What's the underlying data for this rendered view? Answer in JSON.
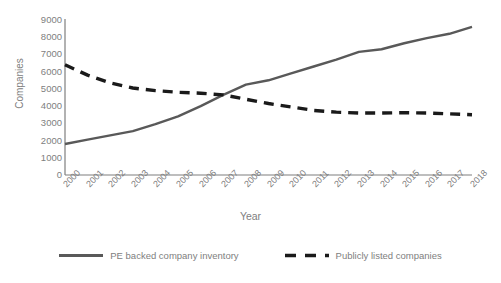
{
  "chart_data": {
    "type": "line",
    "title": "",
    "xlabel": "Year",
    "ylabel": "Companies",
    "categories": [
      "2000",
      "2001",
      "2002",
      "2003",
      "2004",
      "2005",
      "2006",
      "2007",
      "2008",
      "2009",
      "2010",
      "2011",
      "2012",
      "2013",
      "2014",
      "2015",
      "2016",
      "2017",
      "2018"
    ],
    "ylim": [
      0,
      9000
    ],
    "xlim": [
      2000,
      2018
    ],
    "yticks": [
      "0",
      "1000",
      "2000",
      "3000",
      "4000",
      "5000",
      "6000",
      "7000",
      "8000",
      "9000"
    ],
    "ytick_values": [
      0,
      1000,
      2000,
      3000,
      4000,
      5000,
      6000,
      7000,
      8000,
      9000
    ],
    "grid": false,
    "legend_position": "bottom",
    "series": [
      {
        "name": "PE backed company inventory",
        "style": "solid",
        "color": "#595959",
        "values": [
          1800,
          2050,
          2300,
          2550,
          2950,
          3400,
          4000,
          4650,
          5250,
          5500,
          5900,
          6300,
          6700,
          7150,
          7300,
          7650,
          7950,
          8200,
          8600
        ]
      },
      {
        "name": "Publicly listed companies",
        "style": "dashed",
        "color": "#1a1a1a",
        "values": [
          6400,
          5800,
          5350,
          5050,
          4900,
          4800,
          4750,
          4650,
          4400,
          4150,
          3950,
          3750,
          3650,
          3600,
          3600,
          3620,
          3600,
          3550,
          3500
        ]
      }
    ]
  },
  "axes": {
    "y_title": "Companies",
    "x_title": "Year"
  },
  "legend": {
    "items": [
      {
        "label": "PE backed company inventory",
        "swatch": "solid-line-swatch"
      },
      {
        "label": "Publicly listed companies",
        "swatch": "dashed-line-swatch"
      }
    ]
  },
  "colors": {
    "series_solid": "#595959",
    "series_dashed": "#1a1a1a",
    "axis": "#7f7f7f",
    "text": "#808080"
  }
}
